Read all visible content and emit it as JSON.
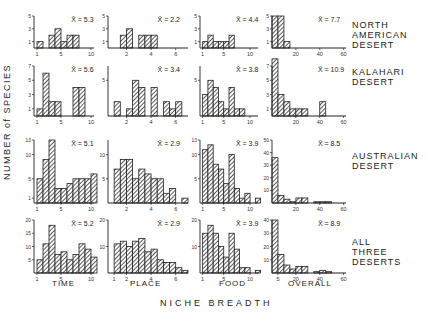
{
  "chart_data": {
    "type": "bar",
    "ylabel": "NUMBER of SPECIES",
    "xlabel": "NICHE BREADTH",
    "columns": [
      "TIME",
      "PLACE",
      "FOOD",
      "OVERALL"
    ],
    "rows": [
      "NORTH AMERICAN DESERT",
      "KALAHARI DESERT",
      "AUSTRALIAN DESERT",
      "ALL THREE DESERTS"
    ],
    "panels": [
      {
        "row": "NORTH AMERICAN DESERT",
        "column": "TIME",
        "mean": "X̄ = 5.3",
        "x_ticks": [
          "1",
          "5",
          "10"
        ],
        "y_ticks": [
          "1",
          "3",
          "5"
        ],
        "ymax": 5,
        "bins_start": 1,
        "bin_width": 1,
        "values": [
          1,
          0,
          2,
          3,
          1,
          2,
          2,
          0,
          0,
          0
        ]
      },
      {
        "row": "NORTH AMERICAN DESERT",
        "column": "PLACE",
        "mean": "X̄ = 2.2",
        "x_ticks": [
          "2",
          "4",
          "6"
        ],
        "y_ticks": [
          "1",
          "3",
          "5"
        ],
        "ymax": 5,
        "bins_start": 1,
        "bin_width": 0.5,
        "values": [
          0,
          2,
          3,
          0,
          2,
          2,
          2,
          0,
          0,
          0,
          0,
          0
        ]
      },
      {
        "row": "NORTH AMERICAN DESERT",
        "column": "FOOD",
        "mean": "X̄ = 4.4",
        "x_ticks": [
          "1",
          "5",
          "10"
        ],
        "y_ticks": [
          "1",
          "3",
          "5"
        ],
        "ymax": 5,
        "bins_start": 1,
        "bin_width": 1,
        "values": [
          1,
          2,
          1,
          1,
          1,
          2,
          0,
          0,
          0,
          0
        ]
      },
      {
        "row": "NORTH AMERICAN DESERT",
        "column": "OVERALL",
        "mean": "X̄ = 7.7",
        "x_ticks": [
          "20",
          "40",
          "60"
        ],
        "y_ticks": [
          "1",
          "3",
          "5"
        ],
        "ymax": 5,
        "bins_start": 0,
        "bin_width": 5,
        "values": [
          5,
          5,
          1,
          0,
          0,
          0,
          0,
          0,
          0,
          0,
          0,
          0
        ]
      },
      {
        "row": "KALAHARI DESERT",
        "column": "TIME",
        "mean": "X̄ = 5.6",
        "x_ticks": [
          "1",
          "5",
          "10"
        ],
        "y_ticks": [
          "1",
          "3",
          "5",
          "7"
        ],
        "ymax": 7,
        "bins_start": 1,
        "bin_width": 1,
        "values": [
          1,
          6,
          2,
          2,
          0,
          0,
          4,
          4,
          0,
          0
        ]
      },
      {
        "row": "KALAHARI DESERT",
        "column": "PLACE",
        "mean": "X̄ = 3.4",
        "x_ticks": [
          "2",
          "4",
          "6"
        ],
        "y_ticks": [
          "5"
        ],
        "ymax": 7,
        "bins_start": 1,
        "bin_width": 0.5,
        "values": [
          2,
          0,
          1,
          5,
          4,
          0,
          4,
          0,
          2,
          1,
          2,
          0
        ]
      },
      {
        "row": "KALAHARI DESERT",
        "column": "FOOD",
        "mean": "X̄ = 3.8",
        "x_ticks": [
          "1",
          "5",
          "10"
        ],
        "y_ticks": [
          "5"
        ],
        "ymax": 7,
        "bins_start": 1,
        "bin_width": 1,
        "values": [
          3,
          5,
          4,
          2,
          1,
          4,
          1,
          1,
          0,
          0
        ]
      },
      {
        "row": "KALAHARI DESERT",
        "column": "OVERALL",
        "mean": "X̄ = 10.9",
        "x_ticks": [
          "20",
          "40",
          "60"
        ],
        "y_ticks": [
          "1",
          "3",
          "5",
          "7"
        ],
        "ymax": 7,
        "bins_start": 0,
        "bin_width": 5,
        "values": [
          8,
          3,
          2,
          1,
          1,
          1,
          0,
          0,
          2,
          0,
          0,
          0
        ]
      },
      {
        "row": "AUSTRALIAN DESERT",
        "column": "TIME",
        "mean": "X̄ = 5.1",
        "x_ticks": [
          "1",
          "5",
          "10"
        ],
        "y_ticks": [
          "1",
          "5",
          "10",
          "13"
        ],
        "ymax": 13,
        "bins_start": 1,
        "bin_width": 1,
        "values": [
          5,
          9,
          13,
          3,
          3,
          4,
          5,
          5,
          5,
          6
        ]
      },
      {
        "row": "AUSTRALIAN DESERT",
        "column": "PLACE",
        "mean": "X̄ = 2.9",
        "x_ticks": [
          "2",
          "4",
          "6"
        ],
        "y_ticks": [
          "5",
          "10"
        ],
        "ymax": 13,
        "bins_start": 1,
        "bin_width": 0.5,
        "values": [
          7,
          9,
          9,
          5,
          7,
          6,
          5,
          5,
          2,
          3,
          0,
          1
        ]
      },
      {
        "row": "AUSTRALIAN DESERT",
        "column": "FOOD",
        "mean": "X̄ = 3.9",
        "x_ticks": [
          "1",
          "5",
          "10"
        ],
        "y_ticks": [
          "5",
          "10",
          "13"
        ],
        "ymax": 13,
        "bins_start": 1,
        "bin_width": 1,
        "values": [
          11,
          12,
          8,
          7,
          4,
          10,
          3,
          1,
          2,
          0,
          1
        ]
      },
      {
        "row": "AUSTRALIAN DESERT",
        "column": "OVERALL",
        "mean": "X̄ = 8.5",
        "x_ticks": [
          "20",
          "40",
          "60"
        ],
        "y_ticks": [
          "10",
          "20",
          "30",
          "40",
          "50"
        ],
        "ymax": 50,
        "bins_start": 0,
        "bin_width": 5,
        "values": [
          36,
          6,
          3,
          1,
          4,
          4,
          0,
          1,
          1,
          1,
          0,
          0
        ]
      },
      {
        "row": "ALL THREE DESERTS",
        "column": "TIME",
        "mean": "X̄ = 5.2",
        "x_ticks": [
          "1",
          "5",
          "10"
        ],
        "y_ticks": [
          "5",
          "10",
          "15",
          "20"
        ],
        "ymax": 20,
        "bins_start": 1,
        "bin_width": 1,
        "values": [
          5,
          11,
          18,
          7,
          8,
          5,
          7,
          11,
          9,
          6
        ]
      },
      {
        "row": "ALL THREE DESERTS",
        "column": "PLACE",
        "mean": "X̄ = 2.9",
        "x_ticks": [
          "1",
          "2",
          "4",
          "6"
        ],
        "y_ticks": [
          "10",
          "20"
        ],
        "ymax": 20,
        "bins_start": 1,
        "bin_width": 0.5,
        "values": [
          11,
          12,
          10,
          12,
          13,
          8,
          9,
          5,
          4,
          4,
          2,
          1
        ]
      },
      {
        "row": "ALL THREE DESERTS",
        "column": "FOOD",
        "mean": "X̄ = 3.9",
        "x_ticks": [
          "1",
          "5",
          "10"
        ],
        "y_ticks": [
          "10",
          "20"
        ],
        "ymax": 20,
        "bins_start": 1,
        "bin_width": 1,
        "values": [
          15,
          18,
          15,
          10,
          6,
          15,
          9,
          2,
          2,
          0,
          1
        ]
      },
      {
        "row": "ALL THREE DESERTS",
        "column": "OVERALL",
        "mean": "X̄ = 8.9",
        "x_ticks": [
          "5",
          "20",
          "40",
          "60"
        ],
        "y_ticks": [
          "10",
          "20",
          "30",
          "40"
        ],
        "ymax": 40,
        "bins_start": 0,
        "bin_width": 5,
        "values": [
          40,
          14,
          6,
          3,
          5,
          5,
          0,
          1,
          2,
          1,
          0,
          0
        ]
      }
    ]
  },
  "labels": {
    "y_axis": "NUMBER of SPECIES",
    "x_axis": "NICHE BREADTH",
    "rows": [
      {
        "line1": "NORTH",
        "line2": "AMERICAN",
        "line3": "DESERT"
      },
      {
        "line1": "KALAHARI",
        "line2": "DESERT",
        "line3": ""
      },
      {
        "line1": "AUSTRALIAN",
        "line2": "DESERT",
        "line3": ""
      },
      {
        "line1": "ALL",
        "line2": "THREE",
        "line3": "DESERTS"
      }
    ],
    "columns": [
      "TIME",
      "PLACE",
      "FOOD",
      "OVERALL"
    ]
  }
}
